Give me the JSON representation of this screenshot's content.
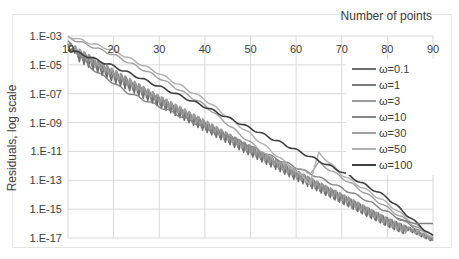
{
  "chart_data": {
    "type": "line",
    "title": "",
    "xlabel": "Number of points",
    "ylabel": "Residuals, log scale",
    "x_axis_position": "top",
    "xlim": [
      10,
      90
    ],
    "ylim_log10": [
      -17,
      -3
    ],
    "x_ticks": [
      "10",
      "20",
      "30",
      "40",
      "50",
      "60",
      "70",
      "80",
      "90"
    ],
    "y_ticks": [
      "1.E-03",
      "1.E-05",
      "1.E-07",
      "1.E-09",
      "1.E-11",
      "1.E-13",
      "1.E-15",
      "1.E-17"
    ],
    "grid": true,
    "legend_position": "right-inside",
    "series": [
      {
        "name": "ω=0.1",
        "color": "#6e6e6e",
        "x": [
          10,
          20,
          30,
          40,
          50,
          60,
          70,
          80,
          90
        ],
        "log10_values": [
          -3.7,
          -5.6,
          -7.3,
          -9.0,
          -10.7,
          -12.4,
          -14.0,
          -15.6,
          -17.0
        ]
      },
      {
        "name": "ω=1",
        "color": "#7a7a7a",
        "x": [
          10,
          20,
          30,
          40,
          50,
          60,
          70,
          80,
          90
        ],
        "log10_values": [
          -3.5,
          -5.4,
          -7.2,
          -8.9,
          -10.6,
          -12.3,
          -14.0,
          -15.6,
          -17.0
        ]
      },
      {
        "name": "ω=3",
        "color": "#9a9a9a",
        "x": [
          10,
          20,
          30,
          40,
          50,
          60,
          70,
          80,
          90
        ],
        "log10_values": [
          -3.4,
          -5.3,
          -7.1,
          -8.8,
          -10.6,
          -12.3,
          -13.9,
          -15.6,
          -17.0
        ]
      },
      {
        "name": "ω=10",
        "color": "#858585",
        "x": [
          10,
          15,
          23,
          33,
          43,
          45,
          55,
          65,
          75,
          90
        ],
        "log10_values": [
          -3.4,
          -5.2,
          -6.9,
          -8.3,
          -9.8,
          -9.9,
          -11.4,
          -12.8,
          -14.3,
          -17.0
        ]
      },
      {
        "name": "ω=30",
        "color": "#a0a0a0",
        "x": [
          10,
          20,
          30,
          40,
          48,
          55,
          63,
          65,
          70,
          80,
          90
        ],
        "log10_values": [
          -3.1,
          -4.3,
          -5.9,
          -7.8,
          -9.9,
          -11.6,
          -12.5,
          -11.8,
          -12.8,
          -14.9,
          -17.0
        ]
      },
      {
        "name": "ω=50",
        "color": "#b0b0b0",
        "x": [
          10,
          20,
          30,
          40,
          50,
          57,
          63,
          65,
          70,
          80,
          90
        ],
        "log10_values": [
          -3.0,
          -4.0,
          -5.6,
          -7.4,
          -9.8,
          -11.6,
          -13.2,
          -11.1,
          -12.6,
          -14.6,
          -17.0
        ]
      },
      {
        "name": "ω=100",
        "color": "#404040",
        "x": [
          10,
          20,
          30,
          40,
          50,
          60,
          70,
          80,
          85,
          90
        ],
        "log10_values": [
          -3.9,
          -5.1,
          -6.5,
          -7.9,
          -9.4,
          -10.9,
          -12.4,
          -14.2,
          -15.6,
          -16.9
        ]
      }
    ]
  }
}
